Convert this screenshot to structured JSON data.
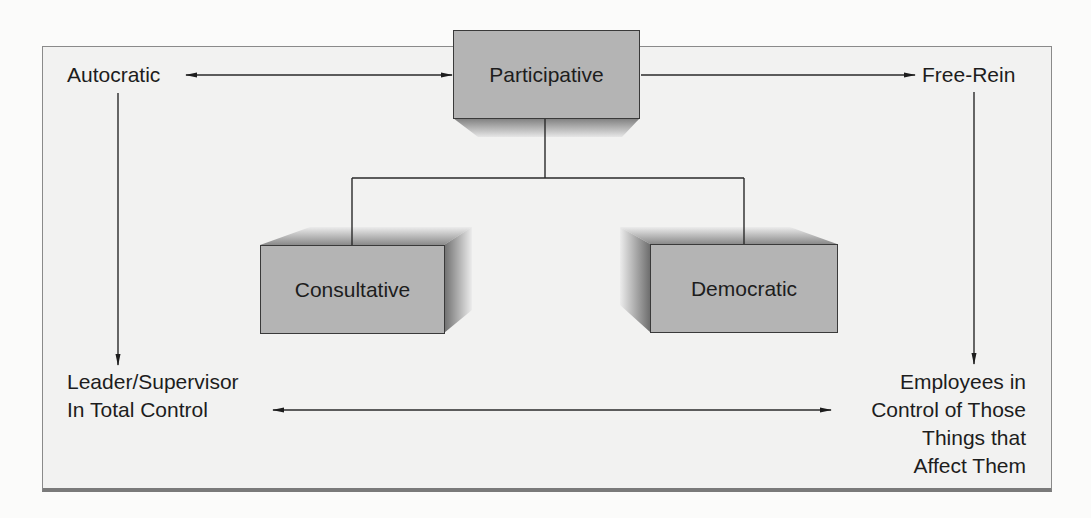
{
  "diagram": {
    "type": "leadership-styles-continuum",
    "nodes": {
      "autocratic": "Autocratic",
      "participative": "Participative",
      "free_rein": "Free-Rein",
      "consultative": "Consultative",
      "democratic": "Democratic"
    },
    "extremes": {
      "left": [
        "Leader/Supervisor",
        "In Total Control"
      ],
      "right": [
        "Employees in",
        "Control of Those",
        "Things that",
        "Affect Them"
      ]
    },
    "edges": [
      {
        "from": "participative",
        "to": "autocratic",
        "style": "bidirectional-arrow"
      },
      {
        "from": "participative",
        "to": "free_rein",
        "style": "arrow"
      },
      {
        "from": "participative",
        "to": "consultative",
        "style": "line"
      },
      {
        "from": "participative",
        "to": "democratic",
        "style": "line"
      },
      {
        "from": "autocratic",
        "to": "left-extreme",
        "style": "arrow"
      },
      {
        "from": "free_rein",
        "to": "right-extreme",
        "style": "arrow"
      },
      {
        "from": "left-extreme",
        "to": "right-extreme",
        "style": "bidirectional-arrow"
      }
    ],
    "colors": {
      "box_fill": "#b4b4b4",
      "frame_fill": "#f2f2f1",
      "line": "#2a2a2a"
    }
  }
}
